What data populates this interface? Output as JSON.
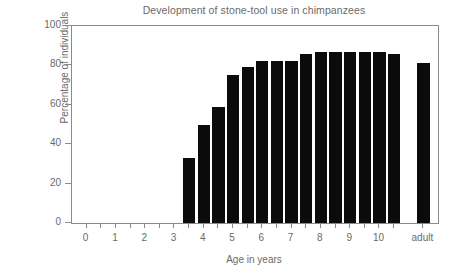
{
  "chart_data": {
    "type": "bar",
    "title": "Development of stone-tool use in chimpanzees",
    "xlabel": "Age in years",
    "ylabel": "Percentage of individuals",
    "ylim": [
      0,
      100
    ],
    "xlim": [
      -0.5,
      12.0
    ],
    "grid": false,
    "legend": null,
    "bar_color": "#0b0b0b",
    "axis_color": "#8a8a8a",
    "text_color": "#6a6a6a",
    "background": "#ffffff",
    "ytick_labels": [
      "0",
      "20",
      "40",
      "60",
      "80",
      "100"
    ],
    "ytick_values": [
      0,
      20,
      40,
      60,
      80,
      100
    ],
    "xtick_labels": [
      "0",
      "1",
      "2",
      "3",
      "4",
      "5",
      "6",
      "7",
      "8",
      "9",
      "10",
      "adult"
    ],
    "xtick_values": [
      0,
      1,
      2,
      3,
      4,
      5,
      6,
      7,
      8,
      9,
      10,
      11.5
    ],
    "xtick_minor_values": [
      0.5,
      1.5,
      2.5,
      3.5,
      4.5,
      5.5,
      6.5,
      7.5,
      8.5,
      9.5,
      10.5
    ],
    "bar_width_years": 0.42,
    "categories": [
      "3.5",
      "4.0",
      "4.5",
      "5.0",
      "5.5",
      "6.0",
      "6.5",
      "7.0",
      "7.5",
      "8.0",
      "8.5",
      "9.0",
      "9.5",
      "10.0",
      "10.5",
      "adult"
    ],
    "x": [
      3.5,
      4.0,
      4.5,
      5.0,
      5.5,
      6.0,
      6.5,
      7.0,
      7.5,
      8.0,
      8.5,
      9.0,
      9.5,
      10.0,
      10.5,
      11.5
    ],
    "values": [
      33,
      50,
      59,
      75,
      79,
      82,
      82,
      82,
      86,
      87,
      87,
      87,
      87,
      87,
      86,
      81
    ]
  },
  "figure": {
    "title": "Development of stone-tool use in chimpanzees",
    "xlabel": "Age in years",
    "ylabel": "Percentage of individuals"
  }
}
